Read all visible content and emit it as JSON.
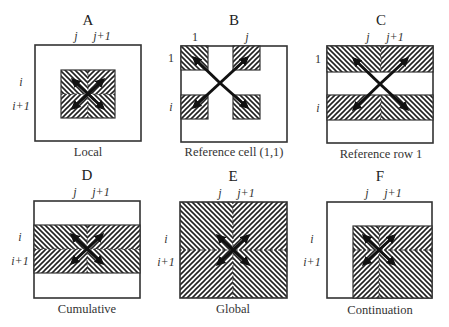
{
  "figure": {
    "panels": [
      {
        "id": "A",
        "title": "A",
        "caption": "Local",
        "col_labels": [
          "j",
          "j+1"
        ],
        "row_labels": [
          "i",
          "i+1"
        ],
        "shading": "central 2x2 block around cell (i,j)"
      },
      {
        "id": "B",
        "title": "B",
        "caption": "Reference cell (1,1)",
        "col_labels": [
          "1",
          "j"
        ],
        "row_labels": [
          "1",
          "i"
        ],
        "shading": "four corner cells (1,1),(1,j),(i,1),(i,j)"
      },
      {
        "id": "C",
        "title": "C",
        "caption": "Reference row 1",
        "col_labels": [
          "j",
          "j+1"
        ],
        "row_labels": [
          "1",
          "i"
        ],
        "shading": "two full-width rows: row 1 and row i"
      },
      {
        "id": "D",
        "title": "D",
        "caption": "Cumulative",
        "col_labels": [
          "j",
          "j+1"
        ],
        "row_labels": [
          "i",
          "i+1"
        ],
        "shading": "full-width band rows i to i+1"
      },
      {
        "id": "E",
        "title": "E",
        "caption": "Global",
        "col_labels": [
          "j",
          "j+1"
        ],
        "row_labels": [
          "i",
          "i+1"
        ],
        "shading": "entire grid"
      },
      {
        "id": "F",
        "title": "F",
        "caption": "Continuation",
        "col_labels": [
          "j",
          "j+1"
        ],
        "row_labels": [
          "i",
          "i+1"
        ],
        "shading": "lower-right region from row i and column j-1 onward"
      }
    ]
  }
}
